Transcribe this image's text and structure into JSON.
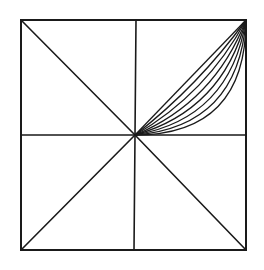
{
  "figure": {
    "stroke_color": "#1a1a1a",
    "background_color": "#ffffff",
    "square": {
      "x1": 21,
      "y1": 20,
      "x2": 246,
      "y2": 250
    },
    "center": {
      "x": 135,
      "y": 135
    },
    "curve_count": 8
  }
}
